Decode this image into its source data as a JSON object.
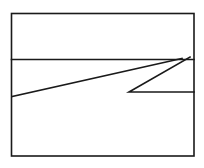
{
  "figure": {
    "title": "Line drawing of a rectangle divided by a horizontal line with an overlaid angular zigzag",
    "background_color": "#ffffff",
    "stroke_color": "#1a1a1a",
    "canvas": {
      "width": 204,
      "height": 168
    },
    "shapes": [
      {
        "name": "outer-rectangle",
        "kind": "rect",
        "x": 11.5,
        "y": 13.5,
        "width": 182.5,
        "height": 142.5,
        "stroke_width": 1.6
      },
      {
        "name": "horizontal-divider",
        "kind": "polyline",
        "points": "11.5,59.5 194,59.5",
        "stroke_width": 1.6
      },
      {
        "name": "long-diagonal",
        "kind": "polyline",
        "points": "12,96.5 182,58.5",
        "stroke_width": 1.6
      },
      {
        "name": "zigzag-wedge",
        "kind": "polyline",
        "points": "190,57 129,92 194,92",
        "stroke_width": 1.6
      }
    ]
  }
}
